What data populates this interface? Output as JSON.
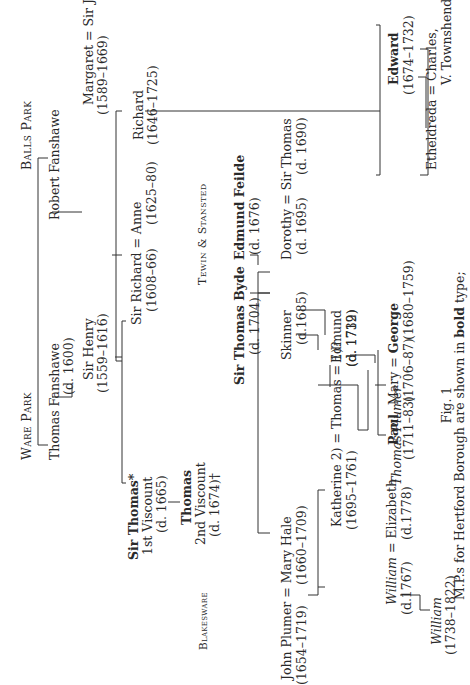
{
  "estates": {
    "ware_park": "Ware Park",
    "balls_park": "Balls Park",
    "tewin_stansted": "Tewin & Stansted",
    "blakesware": "Blakesware"
  },
  "people": {
    "thomas_fanshawe": {
      "name": "Thomas Fanshawe",
      "dates": "(d. 1600)"
    },
    "robert_fanshawe": {
      "name": "Robert Fanshawe"
    },
    "sir_henry": {
      "name": "Sir Henry",
      "dates": "(1559–1616)"
    },
    "margaret": {
      "name": "Margaret"
    },
    "sir_john_harrison": {
      "name": "Sir John Harrison",
      "dates": "(1589–1669)"
    },
    "sir_thomas_1st": {
      "name": "Sir Thomas*",
      "title": "1st Viscount",
      "dates": "(d. 1665)"
    },
    "sir_richard": {
      "name": "Sir Richard",
      "dates": "(1608–66)"
    },
    "anne": {
      "name": "Anne",
      "dates": "(1625–80)"
    },
    "richard": {
      "name": "Richard",
      "dates": "(1646–1725)"
    },
    "thomas_2nd": {
      "name": "Thomas",
      "title": "2nd Viscount",
      "dates": "(d. 1674)†"
    },
    "sir_thomas_byde": {
      "name": "Sir Thomas Byde",
      "dates": "(d. 1704)"
    },
    "edmund_feilde": {
      "name": "Edmund Feilde",
      "dates": "(d. 1676)"
    },
    "skinner": {
      "name": "Skinner",
      "dates": "(d.1685)"
    },
    "dorothy": {
      "name": "Dorothy",
      "dates": "(d. 1695)"
    },
    "sir_thomas_feilde": {
      "name": "Sir Thomas",
      "dates": "(d. 1690)"
    },
    "john_plumer": {
      "name": "John Plumer",
      "dates": "(1654–1719)"
    },
    "mary_hale": {
      "name": "Mary Hale",
      "dates": "(1660–1709)"
    },
    "katherine": {
      "name": "Katherine 2)",
      "dates": "(1695–1761)"
    },
    "thomas_plumer_sr": {
      "name": "Thomas",
      "note": "= 1)?",
      "dates": "(d. 1732)"
    },
    "thomas_plumer_it": {
      "name": "Thomas Plumer"
    },
    "edmund_jr": {
      "name": "Edmund",
      "dates": "(d. 1719)"
    },
    "william_sr": {
      "name": "William",
      "dates": "(d.1767)"
    },
    "elizabeth": {
      "name": "Elizabeth",
      "dates": "(d.1778)"
    },
    "william_jr": {
      "name": "William",
      "dates": "(1738–1822)"
    },
    "paul": {
      "name": "Paul",
      "dates": "(1711–83)"
    },
    "mary": {
      "name": "Mary",
      "dates": "(1706–87)"
    },
    "george": {
      "name": "George",
      "dates": "(1680–1759)"
    },
    "edward": {
      "name": "Edward",
      "dates": "(1674–1732)"
    },
    "etheldreda": {
      "name": "Etheldreda"
    },
    "charles_townshend": {
      "name": "Charles,",
      "title": "V. Townshend"
    }
  },
  "symbols": {
    "marriage": "="
  },
  "caption": {
    "figure": "Fig. 1",
    "line1_prefix": "M.P.s for Hertford Borough are shown in ",
    "line1_bold": "bold",
    "line1_suffix": " type;"
  }
}
